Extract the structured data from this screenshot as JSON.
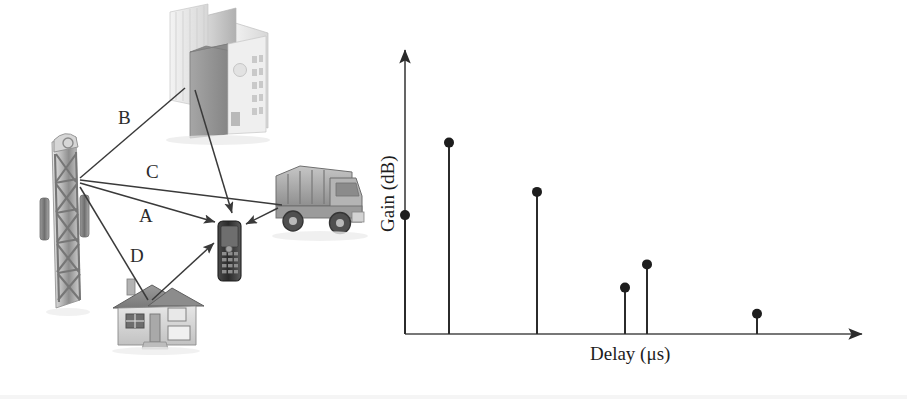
{
  "figure": {
    "background_color": "#ffffff",
    "ink_color": "#2b2b2b"
  },
  "scene": {
    "name": "multipath-propagation-scene",
    "transmitter": {
      "label": "base-station-tower",
      "icon": "cell-tower-icon"
    },
    "receiver": {
      "label": "mobile-handset",
      "icon": "mobile-phone-icon"
    },
    "scatterers": [
      {
        "id": "building",
        "icon": "office-building-icon",
        "label": ""
      },
      {
        "id": "truck",
        "icon": "dump-truck-icon",
        "label": ""
      },
      {
        "id": "house",
        "icon": "house-icon",
        "label": ""
      }
    ],
    "path_labels": [
      {
        "id": "B",
        "text": "B",
        "x": 118,
        "y": 108,
        "description": "reflection off tall building"
      },
      {
        "id": "C",
        "text": "C",
        "x": 146,
        "y": 162,
        "description": "reflection off truck"
      },
      {
        "id": "A",
        "text": "A",
        "x": 139,
        "y": 206,
        "description": "line of sight path"
      },
      {
        "id": "D",
        "text": "D",
        "x": 130,
        "y": 246,
        "description": "reflection off house"
      }
    ]
  },
  "chart_data": {
    "type": "bar",
    "style": "stem",
    "title": "",
    "subtitle": "",
    "xlabel": "Delay (μs)",
    "ylabel": "Gain (dB)",
    "grid": false,
    "legend": null,
    "axis_arrows": true,
    "tick_labels_x": [],
    "tick_labels_y": [],
    "xlim": [
      0,
      100
    ],
    "ylim": [
      0,
      100
    ],
    "categories": [
      "A",
      "B",
      "C",
      "D",
      "E",
      "F"
    ],
    "x": [
      0,
      10,
      30,
      50,
      55,
      80
    ],
    "values": [
      41,
      66,
      49,
      16,
      24,
      7
    ],
    "series": [
      {
        "name": "Power delay profile",
        "values": [
          41,
          66,
          49,
          16,
          24,
          7
        ]
      }
    ],
    "marker": "filled-circle",
    "marker_color": "#1d1d1d",
    "stem_color": "#2b2b2b"
  },
  "axis": {
    "x_label_text": "Delay (μs)",
    "y_label_text": "Gain (dB)"
  }
}
